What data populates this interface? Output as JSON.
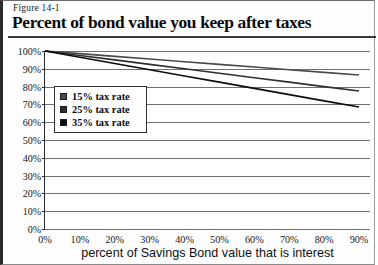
{
  "figure": {
    "number": "Figure 14-1",
    "title": "Percent of bond value you keep after taxes"
  },
  "legend": {
    "items": [
      {
        "label": "15% tax rate",
        "color": "#4a4a4a"
      },
      {
        "label": "25% tax rate",
        "color": "#2e2e2e"
      },
      {
        "label": "35% tax rate",
        "color": "#0d0d0d"
      }
    ]
  },
  "axes": {
    "y_ticks": [
      "100%",
      "90%",
      "80%",
      "70%",
      "60%",
      "50%",
      "40%",
      "30%",
      "20%",
      "10%",
      "0%"
    ],
    "x_ticks": [
      "0%",
      "10%",
      "20%",
      "30%",
      "40%",
      "50%",
      "60%",
      "70%",
      "80%",
      "90%"
    ],
    "x_title": "percent of Savings Bond value that is interest",
    "y_title": ""
  },
  "chart_data": {
    "type": "line",
    "title": "Percent of bond value you keep after taxes",
    "subtitle": "Figure 14-1",
    "xlabel": "percent of Savings Bond value that is interest",
    "ylabel": "",
    "xlim": [
      0,
      90
    ],
    "ylim": [
      0,
      100
    ],
    "xticks": [
      0,
      10,
      20,
      30,
      40,
      50,
      60,
      70,
      80,
      90
    ],
    "yticks": [
      0,
      10,
      20,
      30,
      40,
      50,
      60,
      70,
      80,
      90,
      100
    ],
    "grid": true,
    "grid_axis": "y",
    "legend_position": "inside-upper-left",
    "x": [
      0,
      10,
      20,
      30,
      40,
      50,
      60,
      70,
      80,
      90
    ],
    "series": [
      {
        "name": "15% tax rate",
        "color": "#4a4a4a",
        "values": [
          100,
          98.5,
          97,
          95.5,
          94,
          92.5,
          91,
          89.5,
          88,
          86.5
        ]
      },
      {
        "name": "25% tax rate",
        "color": "#2e2e2e",
        "values": [
          100,
          97.5,
          95,
          92.5,
          90,
          87.5,
          85,
          82.5,
          80,
          77.5
        ]
      },
      {
        "name": "35% tax rate",
        "color": "#0d0d0d",
        "values": [
          100,
          96.5,
          93,
          89.5,
          86,
          82.5,
          79,
          75.5,
          72,
          68.5
        ]
      }
    ]
  }
}
